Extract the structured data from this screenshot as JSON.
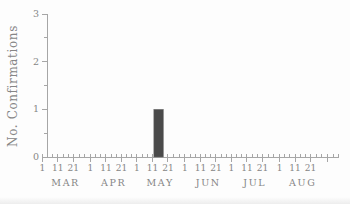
{
  "figure": {
    "background": "#fdfdfd"
  },
  "chart_data": {
    "type": "bar",
    "title": "",
    "xlabel": "",
    "ylabel": "No. Confirmations",
    "ylim": [
      0,
      3
    ],
    "y_ticks": [
      "0",
      "1",
      "2",
      "3"
    ],
    "y_minor_tick_interval": 0.5,
    "grid": "off",
    "legend": "none",
    "x_axis": {
      "unit": "date",
      "visible_range": "early MAR to early SEP",
      "months": [
        "MAR",
        "APR",
        "MAY",
        "JUN",
        "JUL",
        "AUG"
      ],
      "major_tick_day_labels": [
        "1",
        "11",
        "21"
      ],
      "minor_ticks_between_majors": 2
    },
    "series": [
      {
        "name": "Confirmations",
        "points": [
          {
            "month": "MAY",
            "day": 15,
            "value": 1
          }
        ]
      }
    ],
    "colors": {
      "bar": "#4a4a4a",
      "bar_edge": "#6e6e6e",
      "axis": "#a6a6a6",
      "text": "#868686"
    }
  }
}
